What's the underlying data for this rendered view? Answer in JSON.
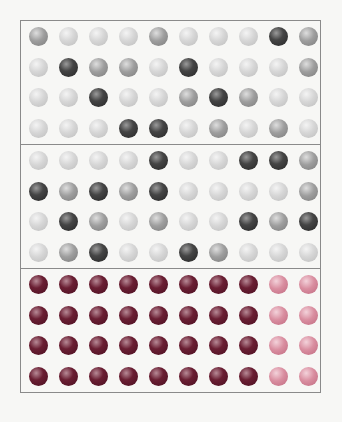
{
  "colors": {
    "frame": "#8a8a8a",
    "light": "#d6d6d6",
    "mid": "#9e9e9e",
    "dark": "#454545",
    "maroon": "#6a1f33",
    "pink": "#d98ea0"
  },
  "sections": [
    {
      "name": "top-gray-grid",
      "rows": [
        [
          "mid",
          "light",
          "light",
          "light",
          "mid",
          "light",
          "light",
          "light",
          "dark",
          "mid"
        ],
        [
          "light",
          "dark",
          "mid",
          "mid",
          "light",
          "dark",
          "light",
          "light",
          "light",
          "mid"
        ],
        [
          "light",
          "light",
          "dark",
          "light",
          "light",
          "mid",
          "dark",
          "mid",
          "light",
          "light"
        ],
        [
          "light",
          "light",
          "light",
          "dark",
          "dark",
          "light",
          "mid",
          "light",
          "mid",
          "light"
        ]
      ]
    },
    {
      "name": "middle-gray-grid",
      "rows": [
        [
          "light",
          "light",
          "light",
          "light",
          "dark",
          "light",
          "light",
          "dark",
          "dark",
          "mid"
        ],
        [
          "dark",
          "mid",
          "dark",
          "mid",
          "dark",
          "light",
          "light",
          "light",
          "light",
          "mid"
        ],
        [
          "light",
          "dark",
          "mid",
          "light",
          "mid",
          "light",
          "light",
          "dark",
          "mid",
          "dark"
        ],
        [
          "light",
          "mid",
          "dark",
          "light",
          "light",
          "dark",
          "mid",
          "light",
          "light",
          "light"
        ]
      ]
    },
    {
      "name": "bottom-colored-grid",
      "rows": [
        [
          "maroon",
          "maroon",
          "maroon",
          "maroon",
          "maroon",
          "maroon",
          "maroon",
          "maroon",
          "pink",
          "pink"
        ],
        [
          "maroon",
          "maroon",
          "maroon",
          "maroon",
          "maroon",
          "maroon",
          "maroon",
          "maroon",
          "pink",
          "pink"
        ],
        [
          "maroon",
          "maroon",
          "maroon",
          "maroon",
          "maroon",
          "maroon",
          "maroon",
          "maroon",
          "pink",
          "pink"
        ],
        [
          "maroon",
          "maroon",
          "maroon",
          "maroon",
          "maroon",
          "maroon",
          "maroon",
          "maroon",
          "pink",
          "pink"
        ]
      ]
    }
  ]
}
